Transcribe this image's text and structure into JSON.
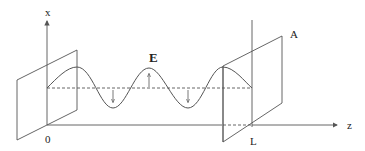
{
  "diagram": {
    "labels": {
      "x_axis": "x",
      "z_axis": "z",
      "origin": "0",
      "end": "L",
      "field": "E",
      "plate": "A"
    },
    "colors": {
      "stroke": "#555555",
      "text": "#222222",
      "background": "#ffffff"
    }
  }
}
